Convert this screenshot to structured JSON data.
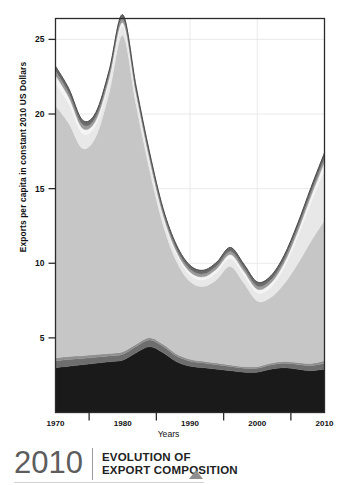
{
  "caption": {
    "year": "2010",
    "line1": "EVOLUTION OF",
    "line2": "EXPORT COMPOSITION",
    "triangle_icon": "triangle-up-icon"
  },
  "axes": {
    "ylabel": "Exports per capita in constant 2010 US Dollars",
    "xlabel": "Years",
    "yticks": [
      "5",
      "10",
      "15",
      "20",
      "25"
    ],
    "xticks": [
      "1970",
      "1980",
      "1990",
      "2000",
      "2010"
    ]
  },
  "colors": {
    "layer1": "#1a1a1a",
    "layer2": "#6e6e6e",
    "layer3": "#8f8f8f",
    "layer4": "#c6c6c6",
    "layer5": "#e8e8e8",
    "layer6": "#f4f4f4",
    "layer7": "#9a9a9a",
    "layer8": "#6a6a6a",
    "axis": "#2b2b2b",
    "grid": "#e4e4e4",
    "caption_year": "#5d5d5d",
    "caption_text": "#222222",
    "triangle": "#8e8e8e"
  },
  "chart_data": {
    "type": "area",
    "title": "EVOLUTION OF EXPORT COMPOSITION",
    "xlabel": "Years",
    "ylabel": "Exports per capita in constant 2010 US Dollars",
    "xlim": [
      1970,
      2010
    ],
    "ylim": [
      0,
      26.4
    ],
    "ytick_values": [
      5,
      10,
      15,
      20,
      25
    ],
    "xtick_values": [
      1970,
      1980,
      1990,
      2000,
      2010
    ],
    "grid": true,
    "legend": "none",
    "stacked": true,
    "x": [
      1970,
      1972,
      1974,
      1976,
      1978,
      1980,
      1982,
      1984,
      1986,
      1988,
      1990,
      1992,
      1994,
      1996,
      1998,
      2000,
      2002,
      2004,
      2006,
      2008,
      2010
    ],
    "series": [
      {
        "name": "layer1",
        "color": "#1a1a1a",
        "values": [
          3.0,
          3.1,
          3.2,
          3.3,
          3.4,
          3.5,
          4.0,
          4.4,
          4.0,
          3.4,
          3.1,
          3.0,
          2.9,
          2.8,
          2.7,
          2.7,
          2.9,
          3.0,
          2.9,
          2.8,
          2.9
        ]
      },
      {
        "name": "layer2",
        "color": "#6e6e6e",
        "values": [
          0.45,
          0.45,
          0.42,
          0.4,
          0.38,
          0.4,
          0.42,
          0.45,
          0.42,
          0.38,
          0.34,
          0.32,
          0.3,
          0.28,
          0.26,
          0.26,
          0.28,
          0.3,
          0.32,
          0.34,
          0.4
        ]
      },
      {
        "name": "layer3",
        "color": "#8f8f8f",
        "values": [
          0.2,
          0.2,
          0.18,
          0.18,
          0.17,
          0.17,
          0.16,
          0.16,
          0.15,
          0.14,
          0.13,
          0.12,
          0.12,
          0.11,
          0.11,
          0.11,
          0.12,
          0.12,
          0.13,
          0.14,
          0.16
        ]
      },
      {
        "name": "layer4",
        "color": "#c6c6c6",
        "values": [
          16.9,
          15.6,
          13.9,
          14.6,
          17.5,
          21.2,
          16.0,
          11.2,
          8.0,
          6.2,
          5.2,
          5.0,
          5.6,
          6.6,
          5.6,
          4.4,
          4.4,
          5.2,
          6.6,
          8.2,
          9.4
        ]
      },
      {
        "name": "layer5",
        "color": "#e8e8e8",
        "values": [
          1.5,
          1.3,
          1.0,
          0.8,
          0.7,
          0.6,
          0.5,
          0.5,
          0.45,
          0.45,
          0.45,
          0.45,
          0.5,
          0.55,
          0.55,
          0.55,
          0.7,
          1.1,
          1.8,
          2.6,
          3.4
        ]
      },
      {
        "name": "layer6",
        "color": "#f4f4f4",
        "values": [
          0.55,
          0.45,
          0.35,
          0.3,
          0.28,
          0.26,
          0.24,
          0.22,
          0.2,
          0.2,
          0.2,
          0.2,
          0.22,
          0.24,
          0.24,
          0.24,
          0.26,
          0.3,
          0.35,
          0.42,
          0.5
        ]
      },
      {
        "name": "layer7",
        "color": "#9a9a9a",
        "values": [
          0.3,
          0.28,
          0.26,
          0.24,
          0.24,
          0.24,
          0.22,
          0.2,
          0.2,
          0.2,
          0.2,
          0.2,
          0.2,
          0.22,
          0.22,
          0.22,
          0.22,
          0.24,
          0.26,
          0.28,
          0.3
        ]
      },
      {
        "name": "layer8",
        "color": "#6a6a6a",
        "values": [
          0.3,
          0.3,
          0.28,
          0.28,
          0.28,
          0.28,
          0.26,
          0.26,
          0.24,
          0.24,
          0.24,
          0.24,
          0.24,
          0.26,
          0.26,
          0.26,
          0.26,
          0.26,
          0.28,
          0.3,
          0.34
        ]
      }
    ],
    "totals": [
      23.2,
      21.68,
      19.59,
      19.9,
      22.75,
      26.45,
      21.8,
      17.19,
      13.66,
      11.21,
      9.87,
      9.53,
      10.08,
      11.06,
      9.94,
      8.74,
      9.14,
      10.52,
      12.64,
      15.08,
      17.4
    ]
  }
}
